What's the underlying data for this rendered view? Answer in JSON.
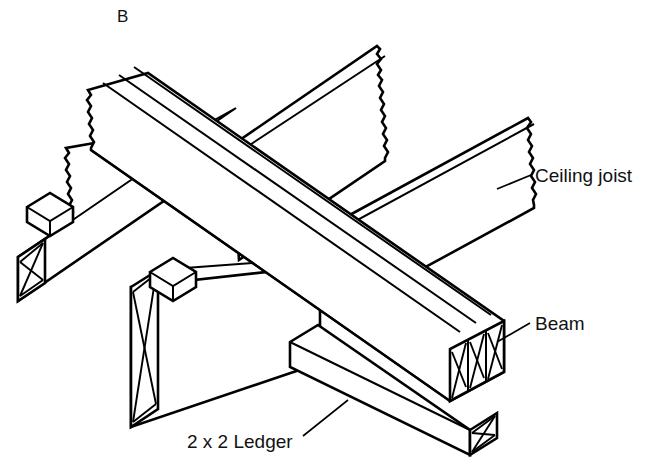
{
  "figure": {
    "panel_label": "B",
    "background_color": "#ffffff",
    "line_color": "#000000"
  },
  "labels": {
    "ceiling_joist": "Ceiling joist",
    "beam": "Beam",
    "ledger": "2 x 2 Ledger"
  },
  "parts": [
    {
      "name": "ceiling-joist-left",
      "label": "Ceiling joist",
      "end_detail": "broken-edge"
    },
    {
      "name": "ceiling-joist-rear",
      "label": "Ceiling joist",
      "end_detail": "broken-edge"
    },
    {
      "name": "ceiling-joist-right",
      "label": "Ceiling joist",
      "end_detail": "broken-edge"
    },
    {
      "name": "ceiling-joist-front",
      "label": "Ceiling joist",
      "end_detail": "end-grain-hatch"
    },
    {
      "name": "built-up-beam",
      "label": "Beam",
      "plies": 3,
      "end_detail": "end-grain-hatch"
    },
    {
      "name": "ledger-strip",
      "label": "2 x 2 Ledger",
      "end_detail": "end-grain-hatch"
    },
    {
      "name": "ledger-block-left",
      "label": "2 x 2 Ledger",
      "end_detail": "block"
    },
    {
      "name": "ledger-block-front",
      "label": "2 x 2 Ledger",
      "end_detail": "block"
    }
  ]
}
